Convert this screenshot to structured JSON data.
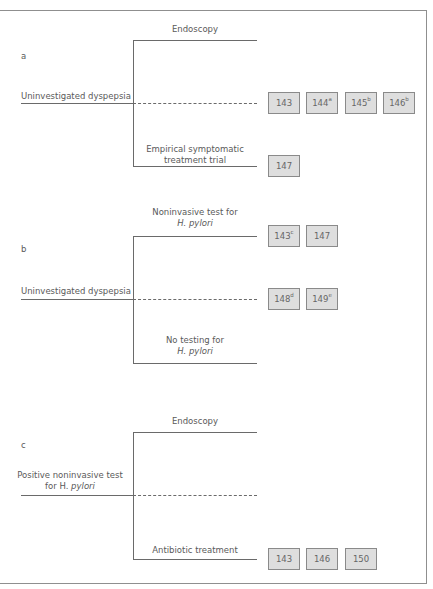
{
  "panels": [
    {
      "label": "a",
      "root": "Uninvestigated dyspepsia",
      "top_branch": "Endoscopy",
      "bottom_branch_line1": "Empirical symptomatic",
      "bottom_branch_line2": "treatment trial",
      "middle_refs": [
        {
          "num": "143",
          "sup": ""
        },
        {
          "num": "144",
          "sup": "a"
        },
        {
          "num": "145",
          "sup": "b"
        },
        {
          "num": "146",
          "sup": "b"
        }
      ],
      "bottom_refs": [
        {
          "num": "147",
          "sup": ""
        }
      ]
    },
    {
      "label": "b",
      "root": "Uninvestigated dyspepsia",
      "top_branch_line1": "Noninvasive test for",
      "top_branch_line2": "H. pylori",
      "bottom_branch_line1": "No testing for",
      "bottom_branch_line2": "H. pylori",
      "top_refs": [
        {
          "num": "143",
          "sup": "c"
        },
        {
          "num": "147",
          "sup": ""
        }
      ],
      "middle_refs": [
        {
          "num": "148",
          "sup": "d"
        },
        {
          "num": "149",
          "sup": "e"
        }
      ]
    },
    {
      "label": "c",
      "root_line1": "Positive noninvasive test",
      "root_line2_prefix": "for H. ",
      "root_line2_italic": "pylori",
      "top_branch": "Endoscopy",
      "bottom_branch": "Antibiotic treatment",
      "bottom_refs": [
        {
          "num": "143",
          "sup": ""
        },
        {
          "num": "146",
          "sup": ""
        },
        {
          "num": "150",
          "sup": ""
        }
      ]
    }
  ]
}
